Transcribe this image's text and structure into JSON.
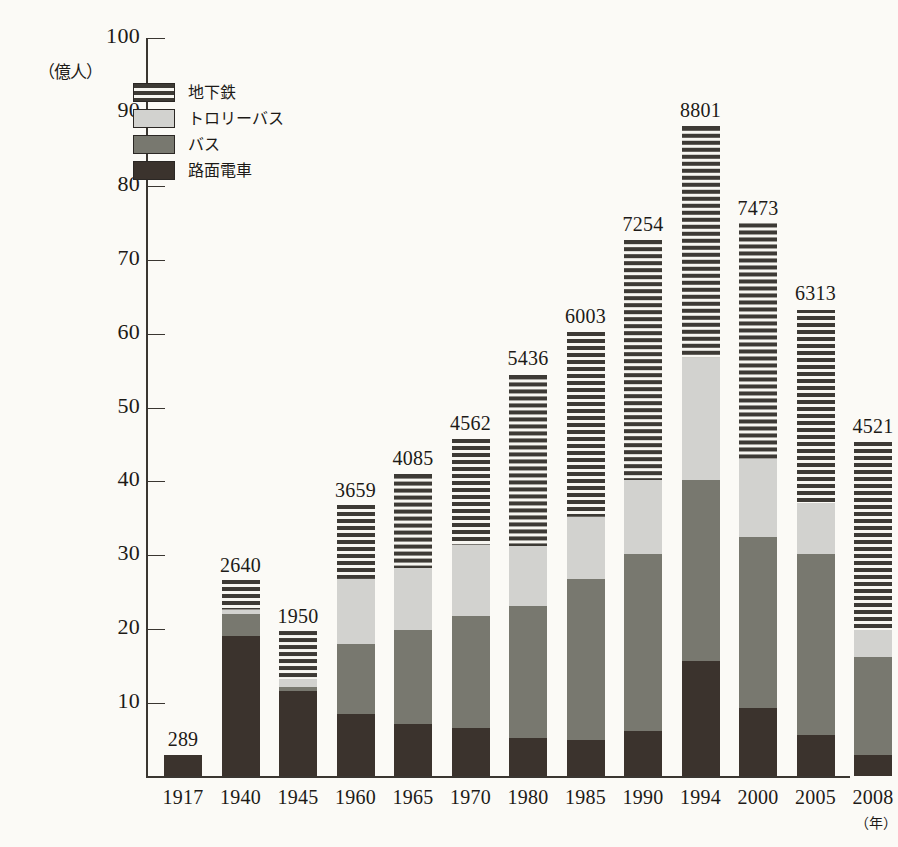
{
  "chart_data": {
    "type": "bar",
    "stacked": true,
    "title": "",
    "xlabel": "年",
    "ylabel": "億人",
    "ylim": [
      0,
      100
    ],
    "ytick_labels": [
      "100",
      "90",
      "80",
      "70",
      "60",
      "50",
      "40",
      "30",
      "20",
      "10"
    ],
    "yticks": [
      100,
      90,
      80,
      70,
      60,
      50,
      40,
      30,
      20,
      10
    ],
    "grid": false,
    "legend_position": "upper-left",
    "categories": [
      "1917",
      "1940",
      "1945",
      "1960",
      "1965",
      "1970",
      "1980",
      "1985",
      "1990",
      "1994",
      "2000",
      "2005",
      "2008"
    ],
    "series": [
      {
        "name": "路面電車",
        "key": "tram",
        "color": "#3b332d",
        "pattern": "solid-dark",
        "values": [
          2.89,
          19.0,
          11.5,
          8.4,
          7.1,
          6.5,
          5.1,
          4.9,
          6.1,
          15.5,
          9.2,
          5.5,
          2.8
        ]
      },
      {
        "name": "バス",
        "key": "bus",
        "color": "#78786f",
        "pattern": "solid-gray",
        "values": [
          0,
          2.9,
          0.5,
          9.4,
          12.6,
          15.2,
          17.9,
          21.8,
          23.9,
          24.5,
          23.1,
          24.5,
          13.3
        ]
      },
      {
        "name": "トロリーバス",
        "key": "trolleybus",
        "color": "#d2d2cf",
        "pattern": "solid-light",
        "values": [
          0,
          0.6,
          1.1,
          8.9,
          8.4,
          9.6,
          8.1,
          8.4,
          10.0,
          16.5,
          10.6,
          7.0,
          3.7
        ]
      },
      {
        "name": "地下鉄",
        "key": "subway",
        "color": "#3d3a35",
        "pattern": "horizontal-stripes",
        "values": [
          0,
          4.0,
          6.5,
          10.0,
          12.8,
          14.3,
          23.2,
          25.0,
          32.5,
          31.5,
          32.0,
          26.0,
          25.4
        ]
      }
    ],
    "totals": [
      2.89,
      26.4,
      19.5,
      36.59,
      40.85,
      45.62,
      54.36,
      60.03,
      72.54,
      88.01,
      74.73,
      63.13,
      45.21
    ],
    "total_labels": [
      "289",
      "2640",
      "1950",
      "3659",
      "4085",
      "4562",
      "5436",
      "6003",
      "7254",
      "8801",
      "7473",
      "6313",
      "4521"
    ]
  },
  "axis": {
    "y_unit_label": "（億人）",
    "x_unit_label": "（年）"
  },
  "legend": {
    "items": [
      {
        "label": "地下鉄",
        "swatch": "subway-swatch"
      },
      {
        "label": "トロリーバス",
        "swatch": "trolleybus-swatch"
      },
      {
        "label": "バス",
        "swatch": "bus-swatch"
      },
      {
        "label": "路面電車",
        "swatch": "tram-swatch"
      }
    ]
  }
}
